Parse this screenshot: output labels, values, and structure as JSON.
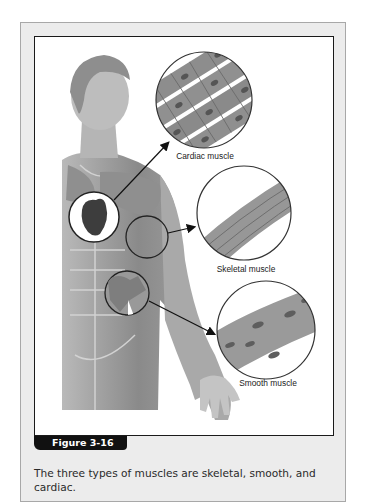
{
  "figure": {
    "badge_label": "Figure 3-16",
    "caption": "The three types of muscles are skeletal, smooth, and cardiac.",
    "labels": {
      "cardiac": "Cardiac muscle",
      "skeletal": "Skeletal muscle",
      "smooth": "Smooth muscle"
    },
    "colors": {
      "frame_fill": "#ececec",
      "frame_border": "#a8a8a8",
      "inner_border": "#1a1a1a",
      "badge_bg": "#111111",
      "badge_text": "#ffffff",
      "caption_text": "#2a2a2a"
    }
  }
}
